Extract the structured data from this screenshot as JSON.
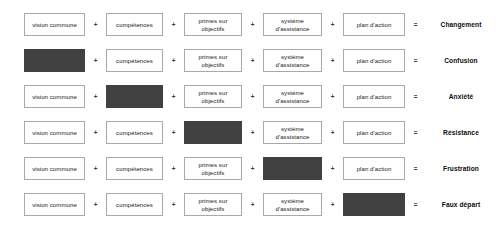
{
  "diagram": {
    "type": "equation-matrix",
    "operators": {
      "plus": "+",
      "equals": "="
    },
    "colors": {
      "box_border": "#a9a9a9",
      "box_fill": "#ffffff",
      "missing_fill": "#414141",
      "text": "#1a1a1a",
      "outcome_text": "#0d0d0d",
      "background": "#ffffff"
    },
    "factors": [
      {
        "key": "vision",
        "label": "vision commune"
      },
      {
        "key": "competences",
        "label": "compétences"
      },
      {
        "key": "primes",
        "label": "primes sur\nobjectifs"
      },
      {
        "key": "assistance",
        "label": "système\nd'assistance"
      },
      {
        "key": "plan",
        "label": "plan d'action"
      }
    ],
    "rows": [
      {
        "outcome": "Changement",
        "missing_index": -1,
        "cells": [
          "vision commune",
          "compétences",
          "primes sur\nobjectifs",
          "système\nd'assistance",
          "plan d'action"
        ]
      },
      {
        "outcome": "Confusion",
        "missing_index": 0,
        "cells": [
          "vision commune",
          "compétences",
          "primes sur\nobjectifs",
          "système\nd'assistance",
          "plan d'action"
        ]
      },
      {
        "outcome": "Anxiété",
        "missing_index": 1,
        "cells": [
          "vision commune",
          "compétences",
          "primes sur\nobjectifs",
          "système\nd'assistance",
          "plan d'action"
        ]
      },
      {
        "outcome": "Résistance",
        "missing_index": 2,
        "cells": [
          "vision commune",
          "compétences",
          "primes sur\nobjectifs",
          "système\nd'assistance",
          "plan d'action"
        ]
      },
      {
        "outcome": "Frustration",
        "missing_index": 3,
        "cells": [
          "vision commune",
          "compétences",
          "primes sur\nobjectifs",
          "système\nd'assistance",
          "plan d'action"
        ]
      },
      {
        "outcome": "Faux départ",
        "missing_index": 4,
        "cells": [
          "vision commune",
          "compétences",
          "primes sur\nobjectifs",
          "système\nd'assistance",
          "plan d'action"
        ]
      }
    ],
    "layout": {
      "row_tops": [
        13,
        49,
        85,
        121,
        157,
        193
      ],
      "columns": [
        {
          "x": 24,
          "w": 61
        },
        {
          "x": 106,
          "w": 57
        },
        {
          "x": 184,
          "w": 58
        },
        {
          "x": 263,
          "w": 59
        },
        {
          "x": 343,
          "w": 62
        }
      ],
      "operator_x": [
        90,
        168,
        247,
        327,
        410
      ],
      "outcome_x": 424,
      "outcome_w": 74
    }
  }
}
